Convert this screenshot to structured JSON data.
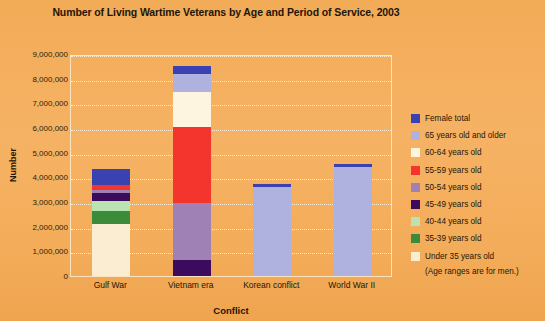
{
  "chart_data": {
    "type": "bar",
    "subtype": "stacked-bar",
    "title": "Number of Living Wartime Veterans by Age and Period of Service, 2003",
    "xlabel": "Conflict",
    "ylabel": "Number",
    "ylim": [
      0,
      9000000
    ],
    "ytick_step": 1000000,
    "grid": true,
    "legend_position": "right",
    "note": "(Age ranges are for men.)",
    "categories": [
      "Gulf War",
      "Vietnam era",
      "Korean conflict",
      "World War II"
    ],
    "ytick_labels": [
      "9,000,000",
      "8,000,000",
      "7,000,000",
      "6,000,000",
      "5,000,000",
      "4,000,000",
      "3,000,000",
      "2,000,000",
      "1,000,000",
      "0"
    ],
    "series": [
      {
        "name": "Under 35 years old",
        "color": "#FAEDD2",
        "values": [
          2100000,
          0,
          0,
          0
        ]
      },
      {
        "name": "35-39 years old",
        "color": "#3B8B3B",
        "values": [
          550000,
          0,
          0,
          0
        ]
      },
      {
        "name": "40-44 years old",
        "color": "#B9E3B0",
        "values": [
          400000,
          0,
          0,
          0
        ]
      },
      {
        "name": "45-49 years old",
        "color": "#3D0B5E",
        "values": [
          300000,
          650000,
          0,
          0
        ]
      },
      {
        "name": "50-54 years old",
        "color": "#A081B5",
        "values": [
          150000,
          2300000,
          0,
          0
        ]
      },
      {
        "name": "55-59 years old",
        "color": "#F4352E",
        "values": [
          200000,
          3100000,
          0,
          0
        ]
      },
      {
        "name": "60-64 years old",
        "color": "#FDF5E0",
        "values": [
          0,
          1400000,
          0,
          0
        ]
      },
      {
        "name": "65 years old and older",
        "color": "#AFB1DF",
        "values": [
          0,
          750000,
          3600000,
          4420000
        ]
      },
      {
        "name": "Female total",
        "color": "#3A41B0",
        "values": [
          650000,
          300000,
          120000,
          130000
        ]
      }
    ],
    "totals": [
      4350000,
      8500000,
      3720000,
      4550000
    ]
  },
  "legend": {
    "items": [
      {
        "label": "Female total",
        "color": "#3A41B0"
      },
      {
        "label": "65 years old and older",
        "color": "#AFB1DF"
      },
      {
        "label": "60-64 years old",
        "color": "#FDF5E0"
      },
      {
        "label": "55-59 years old",
        "color": "#F4352E"
      },
      {
        "label": "50-54 years old",
        "color": "#A081B5"
      },
      {
        "label": "45-49 years old",
        "color": "#3D0B5E"
      },
      {
        "label": "40-44 years old",
        "color": "#B9E3B0"
      },
      {
        "label": "35-39 years old",
        "color": "#3B8B3B"
      },
      {
        "label": "Under 35 years old",
        "color": "#FAEDD2"
      }
    ],
    "note": "(Age ranges are for men.)"
  },
  "colors": {
    "background": "#F4AE5C",
    "plot_border": "#FBE3BE",
    "gridline": "#FDF0DA",
    "text": "#1e1608"
  }
}
